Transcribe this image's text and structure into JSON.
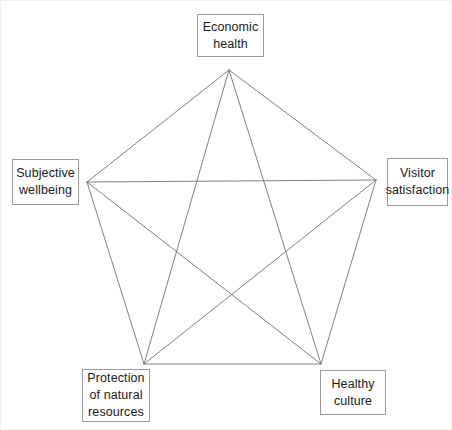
{
  "diagram": {
    "type": "pentagram",
    "background_color": "#ffffff",
    "line_color": "#808080",
    "line_width": 1,
    "box_border_color": "#9a9a9a",
    "text_color": "#1a1a1a",
    "nodes": [
      {
        "id": "economic-health",
        "label": "Economic\nhealth",
        "position": "top",
        "vertex": {
          "x": 228,
          "y": 69
        }
      },
      {
        "id": "visitor-satisfaction",
        "label": "Visitor\nsatisfaction",
        "position": "right",
        "vertex": {
          "x": 375,
          "y": 179
        }
      },
      {
        "id": "healthy-culture",
        "label": "Healthy\nculture",
        "position": "bottom-right",
        "vertex": {
          "x": 320,
          "y": 363
        }
      },
      {
        "id": "protection-natural-resources",
        "label": "Protection\nof natural\nresources",
        "position": "bottom-left",
        "vertex": {
          "x": 143,
          "y": 363
        }
      },
      {
        "id": "subjective-wellbeing",
        "label": "Subjective\nwellbeing",
        "position": "left",
        "vertex": {
          "x": 86,
          "y": 181
        }
      }
    ],
    "edges": [
      {
        "from": "economic-health",
        "to": "visitor-satisfaction",
        "kind": "perimeter"
      },
      {
        "from": "visitor-satisfaction",
        "to": "healthy-culture",
        "kind": "perimeter"
      },
      {
        "from": "healthy-culture",
        "to": "protection-natural-resources",
        "kind": "perimeter"
      },
      {
        "from": "protection-natural-resources",
        "to": "subjective-wellbeing",
        "kind": "perimeter"
      },
      {
        "from": "subjective-wellbeing",
        "to": "economic-health",
        "kind": "perimeter"
      },
      {
        "from": "economic-health",
        "to": "healthy-culture",
        "kind": "diagonal"
      },
      {
        "from": "economic-health",
        "to": "protection-natural-resources",
        "kind": "diagonal"
      },
      {
        "from": "visitor-satisfaction",
        "to": "protection-natural-resources",
        "kind": "diagonal"
      },
      {
        "from": "visitor-satisfaction",
        "to": "subjective-wellbeing",
        "kind": "diagonal"
      },
      {
        "from": "healthy-culture",
        "to": "subjective-wellbeing",
        "kind": "diagonal"
      }
    ]
  }
}
